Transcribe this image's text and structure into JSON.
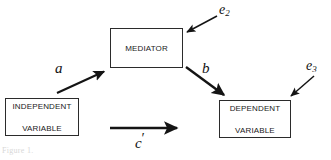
{
  "diagram": {
    "type": "mediation-model-path-diagram",
    "background_color": "#ffffff",
    "stroke_color": "#1a1a1a",
    "nodes": [
      {
        "id": "mediator",
        "label": "MEDIATOR"
      },
      {
        "id": "independent",
        "label_line1": "INDEPENDENT",
        "label_line2": "VARIABLE"
      },
      {
        "id": "dependent",
        "label_line1": "DEPENDENT",
        "label_line2": "VARIABLE"
      }
    ],
    "path_labels": {
      "a": "a",
      "b": "b",
      "c_prime_base": "c",
      "c_prime_mark": "′",
      "e2_base": "e",
      "e2_sub": "2",
      "e3_base": "e",
      "e3_sub": "3"
    },
    "caption": "Figure 1."
  }
}
